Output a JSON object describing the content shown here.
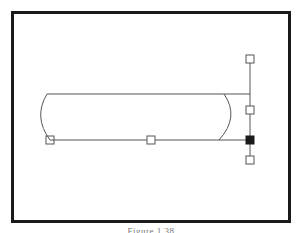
{
  "figure": {
    "caption": "Figure 1.38",
    "colors": {
      "background": "#ffffff",
      "frame_border": "#1a1a1a",
      "stroke": "#555555",
      "handle_fill": "#ffffff",
      "handle_selected_fill": "#1a1a1a"
    }
  },
  "shape": {
    "type": "rounded-bar-with-bezier-ends",
    "top_line": {
      "x1": 47,
      "y1": 94,
      "x2": 250,
      "y2": 94
    },
    "bottom_line": {
      "x1": 50,
      "y1": 140,
      "x2": 250,
      "y2": 140
    },
    "control_axis": {
      "x1": 250,
      "y1": 59,
      "x2": 250,
      "y2": 160
    }
  },
  "handles": [
    {
      "name": "top-control-handle",
      "x": 250,
      "y": 59,
      "selected": false
    },
    {
      "name": "mid-control-handle",
      "x": 250,
      "y": 110,
      "selected": false
    },
    {
      "name": "anchor-handle",
      "x": 250,
      "y": 140,
      "selected": true
    },
    {
      "name": "bottom-control-handle",
      "x": 250,
      "y": 160,
      "selected": false
    },
    {
      "name": "midpoint-handle",
      "x": 151,
      "y": 140,
      "selected": false
    },
    {
      "name": "left-endpoint-handle",
      "x": 50,
      "y": 140,
      "selected": false
    }
  ]
}
